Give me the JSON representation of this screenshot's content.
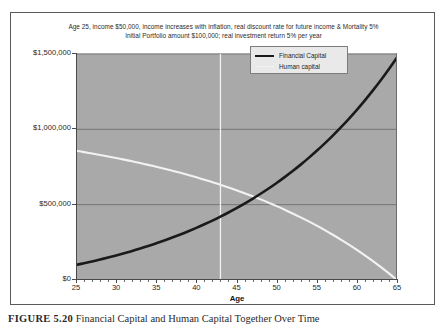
{
  "chart_data": {
    "type": "line",
    "title": "Age 25, income $50,000, income increases with inflation, real discount rate for future income & Mortality 5%\nInitial Portfolio amount $100,000; real investment return 5% per year",
    "title_lines": [
      "Age 25, income $50,000, income increases with inflation, real discount rate for future income & Mortality 5%",
      "Initial Portfolio amount $100,000; real investment return 5% per year"
    ],
    "xlabel": "Age",
    "ylabel": "",
    "xlim": [
      25,
      65
    ],
    "ylim": [
      0,
      1500000
    ],
    "grid": true,
    "legend_position": "upper-right",
    "x": [
      25,
      27,
      29,
      31,
      33,
      35,
      37,
      39,
      41,
      43,
      45,
      47,
      49,
      51,
      53,
      55,
      57,
      59,
      61,
      63,
      65
    ],
    "series": [
      {
        "name": "Financial Capital",
        "color": "#1a1a1a",
        "values": [
          100000,
          131000,
          166000,
          205000,
          249000,
          298000,
          353000,
          415000,
          484000,
          562000,
          649000,
          746000,
          855000,
          976000,
          1000000,
          1000000,
          1000000,
          1000000,
          1000000,
          1000000,
          1330000
        ]
      },
      {
        "name": "Human capital",
        "color": "#f2f2f2",
        "values": [
          845000,
          835000,
          822000,
          806000,
          787000,
          764000,
          737000,
          706000,
          670000,
          629000,
          583000,
          532000,
          476000,
          415000,
          350000,
          283000,
          215000,
          148000,
          86000,
          34000,
          0
        ]
      }
    ],
    "y_ticks": [
      {
        "value": 0,
        "label": "$0"
      },
      {
        "value": 500000,
        "label": "$500,000"
      },
      {
        "value": 1000000,
        "label": "$1,000,000"
      },
      {
        "value": 1500000,
        "label": "$1,500,000"
      }
    ],
    "x_ticks": [
      {
        "value": 25,
        "label": "25"
      },
      {
        "value": 30,
        "label": "30"
      },
      {
        "value": 35,
        "label": "35"
      },
      {
        "value": 40,
        "label": "40"
      },
      {
        "value": 45,
        "label": "45"
      },
      {
        "value": 50,
        "label": "50"
      },
      {
        "value": 55,
        "label": "55"
      },
      {
        "value": 60,
        "label": "60"
      },
      {
        "value": 65,
        "label": "65"
      }
    ],
    "annotations": [
      {
        "type": "vertical-line",
        "x": 43,
        "color": "#f2f2f2",
        "label": ""
      }
    ],
    "crossover": {
      "x": 49,
      "y": 530000
    },
    "plot_background": "#a9a9a9"
  },
  "legend": {
    "items": [
      {
        "label": "Financial Capital",
        "swatch": "financial"
      },
      {
        "label": "Human capital",
        "swatch": "human"
      }
    ]
  },
  "caption": {
    "number": "FIGURE 5.20",
    "text": "Financial Capital and Human Capital Together Over Time"
  }
}
